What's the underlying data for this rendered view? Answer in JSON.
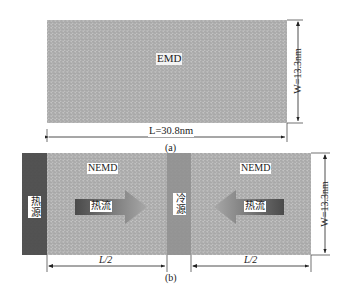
{
  "panel_a": {
    "region_label": "EMD",
    "length_label": "L=30.8nm",
    "width_label": "W=13.3nm",
    "caption": "(a)"
  },
  "panel_b": {
    "left_region_label": "NEMD",
    "right_region_label": "NEMD",
    "hot_source_label": "热源",
    "cold_source_label": "冷源",
    "left_flow_label": "热流",
    "right_flow_label": "热流",
    "left_half_label": "L/2",
    "right_half_label": "L/2",
    "width_label": "W=13.3nm",
    "caption": "(b)"
  },
  "colors": {
    "lattice_bg": "#bdbdbd",
    "lattice_line": "#8a8a8a",
    "hot_source": "#4a4a4a",
    "cold_source": "#9a9a9a",
    "arrow_dark": "#4d4d4d",
    "arrow_light": "#a8a8a8"
  }
}
